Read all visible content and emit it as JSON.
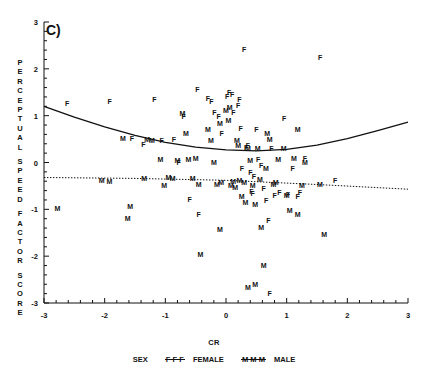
{
  "figure": {
    "panel_label": "C)",
    "ylabel_lines": [
      "PERCEPTUAL",
      "SPEED",
      "FACTOR",
      "SCORE"
    ],
    "xlabel": "CR"
  },
  "legend": {
    "title": "SEX",
    "female_mark": "F F F",
    "female_label": "FEMALE",
    "male_mark": "M M M",
    "male_label": "MALE"
  },
  "chart_data": {
    "type": "scatter",
    "title": "C)",
    "xlabel": "CR",
    "ylabel": "PERCEPTUAL SPEED FACTOR SCORE",
    "xlim": [
      -3,
      3
    ],
    "ylim": [
      -3,
      3
    ],
    "xticks": [
      -3,
      -2,
      -1,
      0,
      1,
      2,
      3
    ],
    "yticks": [
      -3,
      -2,
      -1,
      0,
      1,
      2,
      3
    ],
    "xtick_labels": [
      "-3",
      "-2",
      "-1",
      "0",
      "1",
      "2",
      "3"
    ],
    "ytick_labels": [
      "-3",
      "-2",
      "-1",
      "0",
      "1",
      "2",
      "3"
    ],
    "grid": false,
    "legend_position": "below-axis",
    "point_marker_is_text": true,
    "series": [
      {
        "name": "FEMALE",
        "marker": "F",
        "color": "#111111",
        "points": [
          [
            -2.62,
            1.28
          ],
          [
            -1.92,
            1.32
          ],
          [
            -1.55,
            0.52
          ],
          [
            -1.36,
            0.4
          ],
          [
            -1.18,
            1.35
          ],
          [
            -1.06,
            0.49
          ],
          [
            -0.86,
            0.5
          ],
          [
            -0.78,
            0.02
          ],
          [
            -0.7,
            1.0
          ],
          [
            -0.6,
            -0.78
          ],
          [
            -0.47,
            1.58
          ],
          [
            -0.3,
            1.38
          ],
          [
            -0.24,
            1.32
          ],
          [
            -0.19,
            1.08
          ],
          [
            -0.12,
            1.0
          ],
          [
            -0.07,
            0.63
          ],
          [
            0.02,
            1.42
          ],
          [
            0.05,
            1.5
          ],
          [
            0.1,
            1.46
          ],
          [
            0.12,
            1.07
          ],
          [
            0.2,
            1.22
          ],
          [
            0.22,
            1.36
          ],
          [
            0.24,
            0.73
          ],
          [
            0.26,
            -0.12
          ],
          [
            0.3,
            2.42
          ],
          [
            0.33,
            0.33
          ],
          [
            0.36,
            0.38
          ],
          [
            0.4,
            -0.2
          ],
          [
            0.42,
            -0.6
          ],
          [
            0.44,
            -0.66
          ],
          [
            0.46,
            -0.28
          ],
          [
            0.5,
            0.72
          ],
          [
            0.53,
            0.08
          ],
          [
            0.58,
            -0.05
          ],
          [
            0.62,
            -0.55
          ],
          [
            0.66,
            -0.8
          ],
          [
            0.7,
            -1.22
          ],
          [
            0.75,
            0.3
          ],
          [
            0.8,
            -0.7
          ],
          [
            0.88,
            -0.62
          ],
          [
            0.96,
            0.95
          ],
          [
            1.02,
            -0.67
          ],
          [
            1.1,
            -0.12
          ],
          [
            1.18,
            -0.72
          ],
          [
            1.22,
            -0.62
          ],
          [
            1.3,
            0.1
          ],
          [
            1.55,
            2.25
          ],
          [
            1.8,
            -0.38
          ],
          [
            0.72,
            -2.78
          ],
          [
            -0.45,
            -1.1
          ]
        ]
      },
      {
        "name": "MALE",
        "marker": "M",
        "color": "#111111",
        "points": [
          [
            -2.78,
            -0.98
          ],
          [
            -2.05,
            -0.38
          ],
          [
            -1.92,
            -0.4
          ],
          [
            -1.7,
            0.52
          ],
          [
            -1.62,
            -1.18
          ],
          [
            -1.58,
            -0.92
          ],
          [
            -1.35,
            -0.33
          ],
          [
            -1.3,
            0.5
          ],
          [
            -1.22,
            0.48
          ],
          [
            -1.08,
            0.08
          ],
          [
            -1.02,
            -0.48
          ],
          [
            -0.95,
            -0.3
          ],
          [
            -0.88,
            -0.33
          ],
          [
            -0.8,
            0.06
          ],
          [
            -0.72,
            1.05
          ],
          [
            -0.66,
            0.62
          ],
          [
            -0.62,
            0.08
          ],
          [
            -0.55,
            -0.33
          ],
          [
            -0.5,
            0.1
          ],
          [
            -0.45,
            -0.45
          ],
          [
            -0.42,
            -1.95
          ],
          [
            -0.3,
            0.72
          ],
          [
            -0.25,
            0.48
          ],
          [
            -0.2,
            0.02
          ],
          [
            -0.15,
            -0.45
          ],
          [
            -0.1,
            0.85
          ],
          [
            -0.08,
            -0.42
          ],
          [
            0.0,
            1.12
          ],
          [
            0.04,
            0.9
          ],
          [
            0.06,
            1.18
          ],
          [
            0.08,
            -0.47
          ],
          [
            0.12,
            -0.4
          ],
          [
            0.15,
            -0.52
          ],
          [
            0.18,
            0.48
          ],
          [
            0.2,
            0.38
          ],
          [
            0.22,
            -0.38
          ],
          [
            0.26,
            -0.72
          ],
          [
            0.3,
            -0.42
          ],
          [
            0.32,
            -0.85
          ],
          [
            0.36,
            0.32
          ],
          [
            0.4,
            0.05
          ],
          [
            0.44,
            -0.48
          ],
          [
            0.48,
            -0.88
          ],
          [
            0.52,
            0.3
          ],
          [
            0.56,
            -0.35
          ],
          [
            0.58,
            -1.38
          ],
          [
            0.62,
            -2.18
          ],
          [
            0.66,
            -0.12
          ],
          [
            0.68,
            0.62
          ],
          [
            0.72,
            0.5
          ],
          [
            0.78,
            -0.45
          ],
          [
            0.82,
            -0.42
          ],
          [
            0.86,
            0.08
          ],
          [
            0.95,
            0.3
          ],
          [
            1.0,
            -0.7
          ],
          [
            1.05,
            -1.02
          ],
          [
            1.12,
            0.1
          ],
          [
            1.18,
            0.72
          ],
          [
            1.25,
            -0.48
          ],
          [
            1.3,
            0.02
          ],
          [
            1.55,
            -0.45
          ],
          [
            1.62,
            -1.52
          ],
          [
            0.36,
            -2.65
          ],
          [
            -0.1,
            -1.42
          ],
          [
            0.48,
            -2.6
          ],
          [
            1.18,
            -1.1
          ]
        ]
      }
    ],
    "fitted_curves": [
      {
        "name": "FEMALE fit",
        "style": "solid",
        "shape": "quadratic",
        "description": "U-shaped quadratic, minimum near CR=0.8",
        "points": [
          [
            -3.0,
            1.2
          ],
          [
            -2.5,
            0.97
          ],
          [
            -2.0,
            0.76
          ],
          [
            -1.5,
            0.58
          ],
          [
            -1.0,
            0.43
          ],
          [
            -0.5,
            0.33
          ],
          [
            0.0,
            0.27
          ],
          [
            0.5,
            0.25
          ],
          [
            1.0,
            0.28
          ],
          [
            1.5,
            0.37
          ],
          [
            2.0,
            0.51
          ],
          [
            2.5,
            0.68
          ],
          [
            3.0,
            0.86
          ]
        ]
      },
      {
        "name": "MALE fit",
        "style": "dotted",
        "shape": "near-linear",
        "description": "Nearly flat, slightly decreasing line",
        "points": [
          [
            -3.0,
            -0.32
          ],
          [
            -1.5,
            -0.34
          ],
          [
            0.0,
            -0.38
          ],
          [
            1.5,
            -0.47
          ],
          [
            3.0,
            -0.57
          ]
        ]
      }
    ]
  }
}
